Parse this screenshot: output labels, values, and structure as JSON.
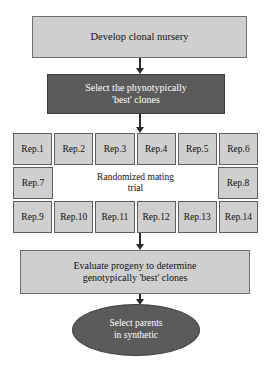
{
  "diagram": {
    "colors": {
      "light_fill": "#cfcfcf",
      "dark_fill": "#5b5b5b",
      "text_dark": "#111111",
      "text_light": "#ffffff",
      "background": "#ffffff"
    },
    "nodes": {
      "develop": {
        "label": "Develop clonal nursery",
        "shape": "rectangle",
        "fill": "light"
      },
      "select_phenotypic": {
        "line1": "Select the phynotypically",
        "line2": "'best' clones",
        "shape": "rectangle",
        "fill": "dark"
      },
      "mating_trial": {
        "line1": "Randomized mating",
        "line2": "trial",
        "shape": "rectangle",
        "fill": "white"
      },
      "evaluate": {
        "line1": "Evaluate progeny to determine",
        "line2": "genotypically 'best' clones",
        "shape": "rectangle",
        "fill": "light"
      },
      "select_parents": {
        "line1": "Select parents",
        "line2": "in synthetic",
        "shape": "ellipse",
        "fill": "dark"
      }
    },
    "rep_grid": {
      "row_top": [
        "Rep.1",
        "Rep.2",
        "Rep.3",
        "Rep.4",
        "Rep.5",
        "Rep.6"
      ],
      "row_middle_left": "Rep.7",
      "row_middle_right": "Rep.8",
      "row_bottom": [
        "Rep.9",
        "Rep.10",
        "Rep.11",
        "Rep.12",
        "Rep.13",
        "Rep.14"
      ]
    },
    "arrows": [
      {
        "name": "develop-to-select",
        "direction": "down"
      },
      {
        "name": "select-to-grid",
        "direction": "down"
      },
      {
        "name": "grid-to-evaluate",
        "direction": "down"
      },
      {
        "name": "evaluate-to-parents",
        "direction": "down"
      }
    ]
  }
}
